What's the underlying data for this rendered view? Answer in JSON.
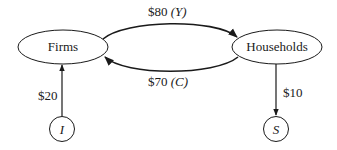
{
  "diagram": {
    "type": "circular-flow",
    "nodes": [
      {
        "id": "firms",
        "label": "Firms",
        "shape": "ellipse"
      },
      {
        "id": "households",
        "label": "Households",
        "shape": "ellipse"
      },
      {
        "id": "investment",
        "label": "I",
        "shape": "circle"
      },
      {
        "id": "saving",
        "label": "S",
        "shape": "circle"
      }
    ],
    "edges": [
      {
        "from": "firms",
        "to": "households",
        "amount": "$80",
        "symbol": "(Y)"
      },
      {
        "from": "households",
        "to": "firms",
        "amount": "$70",
        "symbol": "(C)"
      },
      {
        "from": "investment",
        "to": "firms",
        "amount": "$20"
      },
      {
        "from": "households",
        "to": "saving",
        "amount": "$10"
      }
    ]
  },
  "labels": {
    "firms": "Firms",
    "households": "Households",
    "investment": "I",
    "saving": "S",
    "income_amount": "$80",
    "income_symbol": "(Y)",
    "consumption_amount": "$70",
    "consumption_symbol": "(C)",
    "investment_amount": "$20",
    "saving_amount": "$10"
  },
  "colors": {
    "stroke": "#1a1a1a",
    "background": "#ffffff"
  }
}
